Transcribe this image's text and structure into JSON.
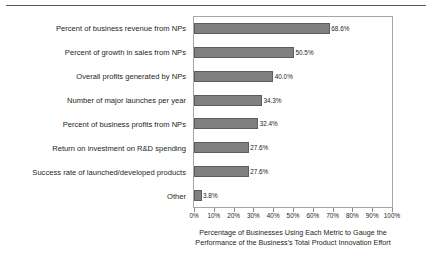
{
  "chart_data": {
    "type": "bar",
    "orientation": "horizontal",
    "title": "",
    "xlabel": "Percentage of Businesses Using Each Metric to Gauge the Performance of the Business's Total Product Innovation Effort",
    "xlabel_lines": [
      "Percentage of Businesses Using Each Metric to Gauge the",
      "Performance of the Business's Total Product Innovation Effort"
    ],
    "ylabel": "",
    "categories": [
      "Percent of business revenue from NPs",
      "Percent of growth in sales from NPs",
      "Overall profits generated by NPs",
      "Number of major launches per year",
      "Percent of business profits from NPs",
      "Return on investment on R&D spending",
      "Success rate of launched/developed products",
      "Other"
    ],
    "values": [
      68.6,
      50.5,
      40.0,
      34.3,
      32.4,
      27.6,
      27.6,
      3.8
    ],
    "data_labels": [
      "68.6%",
      "50.5%",
      "40.0%",
      "34.3%",
      "32.4%",
      "27.6%",
      "27.6%",
      "3.8%"
    ],
    "xlim": [
      0,
      100
    ],
    "xticks": [
      0,
      10,
      20,
      30,
      40,
      50,
      60,
      70,
      80,
      90,
      100
    ],
    "xticklabels": [
      "0%",
      "10%",
      "20%",
      "30%",
      "40%",
      "50%",
      "60%",
      "70%",
      "80%",
      "90%",
      "100%"
    ],
    "grid": false,
    "legend": null,
    "bar_color": "#808080",
    "bar_edge_color": "#5e5e5e",
    "plot_border_color": "#a6a6a6",
    "text_color": "#231f20",
    "background": "#ffffff"
  }
}
